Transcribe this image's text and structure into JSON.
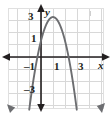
{
  "figure": {
    "name": "parabola-graph",
    "width": 112,
    "height": 117,
    "background": "#ffffff"
  },
  "colors": {
    "grid": "#d8d8d8",
    "axis": "#231f20",
    "curve": "#6d6e71",
    "label": "#231f20",
    "border": "#e4e4e4"
  },
  "axes": {
    "x_label": "x",
    "y_label": "y",
    "x_ticks": [
      {
        "value": 1,
        "label": "1"
      },
      {
        "value": 3,
        "label": "3"
      }
    ],
    "y_ticks": [
      {
        "value": 3,
        "label": "3"
      },
      {
        "value": 1,
        "label": "1"
      },
      {
        "value": -1,
        "label": "–1"
      },
      {
        "value": -3,
        "label": "–3"
      }
    ],
    "xlim": [
      -2.6,
      4.5
    ],
    "ylim": [
      -4.1,
      3.9
    ],
    "grid": true,
    "grid_step": 1,
    "arrows": [
      "left",
      "right",
      "up",
      "down"
    ]
  },
  "chart_data": {
    "type": "line",
    "title": "",
    "xlabel": "x",
    "ylabel": "y",
    "xlim": [
      -2.6,
      4.5
    ],
    "ylim": [
      -4.1,
      3.9
    ],
    "grid": true,
    "legend": "none",
    "series": [
      {
        "name": "parabola",
        "shape": "downward-opening parabola",
        "equation": "y = -x^2 + 2x + 3",
        "vertex": [
          1,
          3.3
        ],
        "x_intercepts": [
          -0.3,
          3.3
        ],
        "y_intercept": 3,
        "color": "#6d6e71",
        "endpoints_have_arrows": true,
        "x": [
          -1.1,
          -0.8,
          -0.5,
          -0.2,
          0.1,
          0.4,
          0.7,
          1.0,
          1.3,
          1.6,
          1.9,
          2.2,
          2.5,
          2.8,
          3.1,
          3.4,
          3.7,
          4.0
        ],
        "y": [
          -0.5,
          0.76,
          1.75,
          2.46,
          2.89,
          3.04,
          2.91,
          3.3,
          2.91,
          3.04,
          2.89,
          2.46,
          1.75,
          0.76,
          -0.51,
          -1.2,
          -2.4,
          -3.7
        ]
      }
    ]
  },
  "annotations": {
    "stray_tick": "faint-tick-mark"
  }
}
